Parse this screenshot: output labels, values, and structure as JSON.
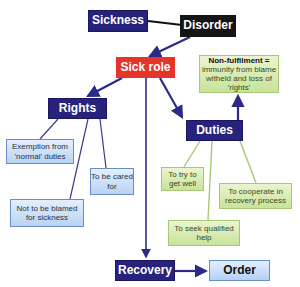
{
  "diagram": {
    "nodes": {
      "sickness": "Sickness",
      "disorder": "Disorder",
      "sick_role": "Sick role",
      "non_fulfilment_title": "Non-fulfilment =",
      "non_fulfilment_body": "immunity from blame witheld and loss of 'rights'",
      "rights": "Rights",
      "duties": "Duties",
      "exemption": "Exemption from 'normal' duties",
      "cared_for": "To be cared for",
      "not_blamed": "Not to be blamed for sickness",
      "try_get_well": "To try to get well",
      "cooperate": "To cooperate in recovery process",
      "seek_help": "To seek qualified help",
      "recovery": "Recovery",
      "order": "Order"
    },
    "colors": {
      "navy": "#27237d",
      "red": "#e5352b",
      "black": "#151515",
      "green_line": "#a8c878",
      "arrow": "#2b2a86"
    }
  }
}
